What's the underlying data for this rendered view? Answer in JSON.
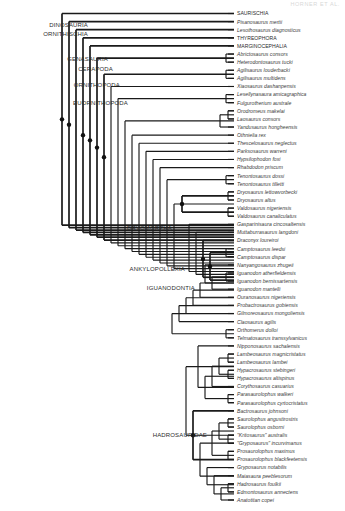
{
  "figure": {
    "header_text": "HORNER ET AL.",
    "background_color": "#ffffff",
    "line_color": "#1a1a1a",
    "taxon_text_color": "#3a3a3a",
    "clade_text_color": "#2b2b2b",
    "type": "cladogram",
    "width": 345,
    "height": 511
  },
  "clade_labels": [
    {
      "name": "DINOSAURIA",
      "text": "DINOSAURIA",
      "x": 88,
      "y": 27
    },
    {
      "name": "ORNITHISCHIA",
      "text": "ORNITHISCHIA",
      "x": 88,
      "y": 36
    },
    {
      "name": "GENASAURIA",
      "text": "GENASAURIA",
      "x": 108,
      "y": 61
    },
    {
      "name": "CERAPODA",
      "text": "CERAPODA",
      "x": 113,
      "y": 71
    },
    {
      "name": "ORNITHOPODA",
      "text": "ORNITHOPODA",
      "x": 120,
      "y": 87
    },
    {
      "name": "EUORNITHOPODA",
      "text": "EUORNITHOPODA",
      "x": 128,
      "y": 105
    },
    {
      "name": "DRYOMORPHA",
      "text": "DRYOMORPHA",
      "x": 172,
      "y": 230
    },
    {
      "name": "ANKYLOPOLLEXIA",
      "text": "ANKYLOPOLLEXIA",
      "x": 185,
      "y": 271
    },
    {
      "name": "IGUANODONTIA",
      "text": "IGUANODONTIA",
      "x": 195,
      "y": 290
    },
    {
      "name": "HADROSAURIDAE",
      "text": "HADROSAURIDAE",
      "x": 207,
      "y": 437
    }
  ],
  "taxa": [
    {
      "id": 0,
      "label": "SAURISCHIA",
      "style": "upright",
      "y": 13.5
    },
    {
      "id": 1,
      "label": "Pisanosaurus mertii",
      "style": "italic",
      "y": 22.0
    },
    {
      "id": 2,
      "label": "Lesothosaurus diagnosticus",
      "style": "italic",
      "y": 30.5
    },
    {
      "id": 3,
      "label": "THYREOPHORA",
      "style": "upright",
      "y": 39.0
    },
    {
      "id": 4,
      "label": "MARGINOCEPHALIA",
      "style": "upright",
      "y": 47.5
    },
    {
      "id": 5,
      "label": "Abrictosaurus consors",
      "style": "italic",
      "y": 56.0
    },
    {
      "id": 6,
      "label": "Heterodontosaurus tucki",
      "style": "italic",
      "y": 64.5
    },
    {
      "id": 7,
      "label": "Agilisaurus louderbacki",
      "style": "italic",
      "y": 73.0
    },
    {
      "id": 8,
      "label": "Agilisaurus multidens",
      "style": "italic",
      "y": 81.5
    },
    {
      "id": 9,
      "label": "Xiaosaurus dashanpensis",
      "style": "italic",
      "y": 90.0
    },
    {
      "id": 10,
      "label": "Lesellynasaura amicagraphica",
      "style": "italic",
      "y": 98.5
    },
    {
      "id": 11,
      "label": "Fulgurotherium australe",
      "style": "italic",
      "y": 107.0
    },
    {
      "id": 12,
      "label": "Orodromeus makelai",
      "style": "italic",
      "y": 115.5
    },
    {
      "id": 13,
      "label": "Laosaurus consors",
      "style": "italic",
      "y": 124.0
    },
    {
      "id": 14,
      "label": "Yandusaurus hongheensis",
      "style": "italic",
      "y": 132.5
    },
    {
      "id": 15,
      "label": "Othnielia rex",
      "style": "italic",
      "y": 141.0
    },
    {
      "id": 16,
      "label": "Thescelosaurus neglectus",
      "style": "italic",
      "y": 149.5
    },
    {
      "id": 17,
      "label": "Parksosaurus warreni",
      "style": "italic",
      "y": 158.0
    },
    {
      "id": 18,
      "label": "Hypsilophodon foxi",
      "style": "italic",
      "y": 166.5
    },
    {
      "id": 19,
      "label": "Rhabdodon priscum",
      "style": "italic",
      "y": 175.0
    },
    {
      "id": 20,
      "label": "Tenontosaurus dossi",
      "style": "italic",
      "y": 183.5
    },
    {
      "id": 21,
      "label": "Tenontosaurus tilletti",
      "style": "italic",
      "y": 192.0
    },
    {
      "id": 22,
      "label": "Dryosaurus lettowvorbecki",
      "style": "italic",
      "y": 200.5
    },
    {
      "id": 23,
      "label": "Dryosaurus altus",
      "style": "italic",
      "y": 209.0
    },
    {
      "id": 24,
      "label": "Valdosaurus nigeriensis",
      "style": "italic",
      "y": 217.5
    },
    {
      "id": 25,
      "label": "Valdosaurus canaliculatus",
      "style": "italic",
      "y": 226.0
    },
    {
      "id": 26,
      "label": "Gasparinisaura cincosaltensis",
      "style": "italic",
      "y": 234.5
    },
    {
      "id": 27,
      "label": "Muttaburrasaurus langdoni",
      "style": "italic",
      "y": 243.0
    },
    {
      "id": 28,
      "label": "Draconyx loureiroi",
      "style": "italic",
      "y": 251.5
    },
    {
      "id": 29,
      "label": "Camptosaurus leedsi",
      "style": "italic",
      "y": 260.0
    },
    {
      "id": 30,
      "label": "Camptosaurus dispar",
      "style": "italic",
      "y": 268.5
    },
    {
      "id": 31,
      "label": "Nanyangosaurus zhugeii",
      "style": "italic",
      "y": 277.0
    },
    {
      "id": 32,
      "label": "Iguanodon atherfieldensis",
      "style": "italic",
      "y": 285.5
    },
    {
      "id": 33,
      "label": "Iguanodon bernissartensis",
      "style": "italic",
      "y": 294.0
    },
    {
      "id": 34,
      "label": "Iguanodon mantelli",
      "style": "italic",
      "y": 302.5
    },
    {
      "id": 35,
      "label": "Ouranosaurus nigeriensis",
      "style": "italic",
      "y": 311.0
    },
    {
      "id": 36,
      "label": "Probactrosaurus gobiensis",
      "style": "italic",
      "y": 319.5
    },
    {
      "id": 37,
      "label": "Gilmoreosaurus mongoliensis",
      "style": "italic",
      "y": 328.0
    },
    {
      "id": 38,
      "label": "Claosaurus agilis",
      "style": "italic",
      "y": 336.5
    },
    {
      "id": 39,
      "label": "Orthomerus dolloi",
      "style": "italic",
      "y": 345.0
    },
    {
      "id": 40,
      "label": "Telmatosaurus transsylvanicus",
      "style": "italic",
      "y": 353.5
    },
    {
      "id": 41,
      "label": "Nipponosaurus sachalensis",
      "style": "italic",
      "y": 362.0
    },
    {
      "id": 42,
      "label": "Lambeosaurus magnicristatus",
      "style": "italic",
      "y": 370.5
    },
    {
      "id": 43,
      "label": "Lambeosaurus lambei",
      "style": "italic",
      "y": 379.0
    },
    {
      "id": 44,
      "label": "Hypacrosaurus stebingeri",
      "style": "italic",
      "y": 387.5
    },
    {
      "id": 45,
      "label": "Hypacrosaurus altispinus",
      "style": "italic",
      "y": 396.0
    },
    {
      "id": 46,
      "label": "Corythosaurus casuarius",
      "style": "italic",
      "y": 404.5
    },
    {
      "id": 47,
      "label": "Parasaurolophus walkeri",
      "style": "italic",
      "y": 413.0
    },
    {
      "id": 48,
      "label": "Parasaurolophus cyrtocristatus",
      "style": "italic",
      "y": 421.5
    },
    {
      "id": 49,
      "label": "Bactrosaurus johnsoni",
      "style": "italic",
      "y": 430.0
    },
    {
      "id": 50,
      "label": "Saurolophus angustirostris",
      "style": "italic",
      "y": 438.5
    },
    {
      "id": 51,
      "label": "Saurolophus osborni",
      "style": "italic",
      "y": 447.0
    },
    {
      "id": 52,
      "label": "\"Kritosaurus\" australis",
      "style": "italic",
      "y": 455.5
    },
    {
      "id": 53,
      "label": "\"Gryposaurus\" incurvimanus",
      "style": "italic",
      "y": 464.0
    },
    {
      "id": 54,
      "label": "Prosaurolophus maximus",
      "style": "italic",
      "y": 472.5
    },
    {
      "id": 55,
      "label": "Prosaurolophus blackfeetensis",
      "style": "italic",
      "y": 481.0
    },
    {
      "id": 56,
      "label": "Gryposaurus notabilis",
      "style": "italic",
      "y": 489.5
    },
    {
      "id": 57,
      "label": "Maiasaura peeblesorum",
      "style": "italic",
      "y": 498.0
    },
    {
      "id": 58,
      "label": "Hadrosaurus foulkii",
      "style": "italic",
      "y": 506.5
    },
    {
      "id": 59,
      "label": "Edmontosaurus annectens",
      "style": "italic",
      "y": 515.0
    },
    {
      "id": 60,
      "label": "Anatotitan copei",
      "style": "italic",
      "y": 523.5
    }
  ],
  "tip_x": 234,
  "label_x": 237,
  "internal_nodes": [
    {
      "name": "dinosauria-node",
      "x": 62,
      "children_y": [
        13.5,
        235.4
      ],
      "dot": true,
      "thick": true
    },
    {
      "name": "ornithischia-node",
      "x": 69,
      "children_y": [
        22.0,
        238.0
      ],
      "dot": true,
      "thick": true
    },
    {
      "name": "node-c",
      "x": 76,
      "children_y": [
        30.5,
        240.5
      ],
      "dot": false,
      "thick": true
    },
    {
      "name": "genasauria-node",
      "x": 83,
      "children_y": [
        39.0,
        243.0
      ],
      "dot": true,
      "thick": true
    },
    {
      "name": "cerapoda-node",
      "x": 90,
      "children_y": [
        47.5,
        245.5
      ],
      "dot": true,
      "thick": true
    },
    {
      "name": "ornithopoda-node",
      "x": 97,
      "children_y": [
        60.2,
        248.0
      ],
      "dot": true,
      "thick": true
    },
    {
      "name": "heterodont-node",
      "x": 226,
      "children_y": [
        56.0,
        64.5
      ],
      "dot": false,
      "thick": false
    },
    {
      "name": "euornithopoda-node",
      "x": 104,
      "children_y": [
        77.2,
        251.0
      ],
      "dot": true,
      "thick": true
    },
    {
      "name": "agilisaurus-node",
      "x": 226,
      "children_y": [
        73.0,
        81.5
      ],
      "dot": false,
      "thick": false
    },
    {
      "name": "node-xiao",
      "x": 111,
      "children_y": [
        90.0,
        254.0
      ],
      "dot": false,
      "thick": false
    },
    {
      "name": "leaell-node",
      "x": 226,
      "children_y": [
        98.5,
        107.0
      ],
      "dot": false,
      "thick": false
    },
    {
      "name": "node-leaell-up",
      "x": 118,
      "children_y": [
        102.7,
        257.0
      ],
      "dot": false,
      "thick": false
    },
    {
      "name": "orodromeus-node",
      "x": 228,
      "children_y": [
        115.5,
        124.0
      ],
      "dot": false,
      "thick": false
    },
    {
      "name": "yandu-node",
      "x": 220,
      "children_y": [
        119.7,
        132.5
      ],
      "dot": false,
      "thick": false
    },
    {
      "name": "node-yandu-up",
      "x": 125,
      "children_y": [
        126.1,
        260.0
      ],
      "dot": false,
      "thick": false
    },
    {
      "name": "node-othnielia",
      "x": 132,
      "children_y": [
        141.0,
        263.0
      ],
      "dot": false,
      "thick": false
    },
    {
      "name": "node-thescelo",
      "x": 139,
      "children_y": [
        149.5,
        266.0
      ],
      "dot": false,
      "thick": false
    },
    {
      "name": "node-parkso",
      "x": 146,
      "children_y": [
        158.0,
        269.0
      ],
      "dot": false,
      "thick": false
    },
    {
      "name": "node-hypsilo",
      "x": 153,
      "children_y": [
        166.5,
        272.0
      ],
      "dot": false,
      "thick": false
    },
    {
      "name": "node-rhabdodon",
      "x": 160,
      "children_y": [
        175.0,
        275.0
      ],
      "dot": false,
      "thick": false
    },
    {
      "name": "tenontosaurus-node",
      "x": 226,
      "children_y": [
        183.5,
        192.0
      ],
      "dot": false,
      "thick": false
    },
    {
      "name": "node-tenonto-up",
      "x": 167,
      "children_y": [
        187.7,
        278.0
      ],
      "dot": false,
      "thick": false
    },
    {
      "name": "dryosaurus-node",
      "x": 228,
      "children_y": [
        200.5,
        209.0
      ],
      "dot": false,
      "thick": false
    },
    {
      "name": "valdosaurus-node",
      "x": 228,
      "children_y": [
        217.5,
        226.0
      ],
      "dot": false,
      "thick": false
    },
    {
      "name": "dryomorpha-node",
      "x": 182,
      "children_y": [
        204.7,
        221.7
      ],
      "dot": true,
      "thick": true
    },
    {
      "name": "node-dryo-up",
      "x": 174,
      "children_y": [
        213.2,
        281.0
      ],
      "dot": false,
      "thick": false
    },
    {
      "name": "node-gaspari",
      "x": 189,
      "children_y": [
        234.5,
        284.0
      ],
      "dot": false,
      "thick": false
    },
    {
      "name": "node-muttabur",
      "x": 196,
      "children_y": [
        243.0,
        287.0
      ],
      "dot": false,
      "thick": false
    },
    {
      "name": "ankylopollexia-node",
      "x": 203,
      "children_y": [
        251.5,
        290.0
      ],
      "dot": true,
      "thick": true
    },
    {
      "name": "camptosaurus-node",
      "x": 226,
      "children_y": [
        260.0,
        268.5
      ],
      "dot": false,
      "thick": false
    },
    {
      "name": "iguanodontia-node",
      "x": 210,
      "children_y": [
        264.2,
        293.0
      ],
      "dot": true,
      "thick": true
    },
    {
      "name": "node-nanyango",
      "x": 205,
      "children_y": [
        277.0,
        296.0
      ],
      "dot": false,
      "thick": false
    },
    {
      "name": "iguanodon-node",
      "x": 226,
      "children_y": [
        285.5,
        294.0
      ],
      "dot": false,
      "thick": false
    },
    {
      "name": "node-iguanodon-up",
      "x": 212,
      "children_y": [
        289.7,
        302.5
      ],
      "dot": false,
      "thick": false
    },
    {
      "name": "node-ouranosaurus",
      "x": 200,
      "children_y": [
        296.0,
        311.0
      ],
      "dot": false,
      "thick": false
    },
    {
      "name": "node-probactro",
      "x": 193,
      "children_y": [
        303.5,
        319.5
      ],
      "dot": false,
      "thick": false
    },
    {
      "name": "node-gilmoreo",
      "x": 186,
      "children_y": [
        311.5,
        328.0
      ],
      "dot": false,
      "thick": false
    },
    {
      "name": "node-claosaurus",
      "x": 179,
      "children_y": [
        319.7,
        336.5
      ],
      "dot": false,
      "thick": false
    },
    {
      "name": "orthomerus-node",
      "x": 226,
      "children_y": [
        345.0,
        353.5
      ],
      "dot": false,
      "thick": false
    },
    {
      "name": "node-ortho-up",
      "x": 172,
      "children_y": [
        328.1,
        349.2
      ],
      "dot": false,
      "thick": false
    },
    {
      "name": "lambeosaurus-node",
      "x": 228,
      "children_y": [
        370.5,
        379.0
      ],
      "dot": false,
      "thick": false
    },
    {
      "name": "hypacrosaurus-node",
      "x": 228,
      "children_y": [
        387.5,
        396.0
      ],
      "dot": false,
      "thick": false
    },
    {
      "name": "node-lamb-hypa",
      "x": 219,
      "children_y": [
        374.7,
        391.7
      ],
      "dot": false,
      "thick": false
    },
    {
      "name": "node-corytho",
      "x": 212,
      "children_y": [
        383.2,
        404.5
      ],
      "dot": false,
      "thick": false
    },
    {
      "name": "parasaurolophus-node",
      "x": 228,
      "children_y": [
        413.0,
        421.5
      ],
      "dot": false,
      "thick": false
    },
    {
      "name": "lambeosaurinae-node",
      "x": 205,
      "children_y": [
        393.8,
        417.2
      ],
      "dot": false,
      "thick": false
    },
    {
      "name": "node-nippono",
      "x": 198,
      "children_y": [
        362.0,
        405.5
      ],
      "dot": false,
      "thick": false
    },
    {
      "name": "saurolophus-node",
      "x": 228,
      "children_y": [
        438.5,
        447.0
      ],
      "dot": false,
      "thick": false
    },
    {
      "name": "kritosaurus-node",
      "x": 228,
      "children_y": [
        455.5,
        464.0
      ],
      "dot": false,
      "thick": false
    },
    {
      "name": "node-sauro-krito",
      "x": 219,
      "children_y": [
        442.7,
        459.7
      ],
      "dot": false,
      "thick": false
    },
    {
      "name": "prosaurolophus-node",
      "x": 228,
      "children_y": [
        472.5,
        481.0
      ],
      "dot": false,
      "thick": false
    },
    {
      "name": "node-pro-up",
      "x": 212,
      "children_y": [
        451.2,
        476.7
      ],
      "dot": false,
      "thick": false
    },
    {
      "name": "edmonto-node",
      "x": 228,
      "children_y": [
        506.5,
        515.0
      ],
      "dot": false,
      "thick": false
    },
    {
      "name": "node-anato",
      "x": 221,
      "children_y": [
        510.7,
        523.5
      ],
      "dot": false,
      "thick": false
    },
    {
      "name": "node-hadrosaurus",
      "x": 214,
      "children_y": [
        498.0,
        517.1
      ],
      "dot": false,
      "thick": false
    },
    {
      "name": "node-maiasaura",
      "x": 207,
      "children_y": [
        489.5,
        507.5
      ],
      "dot": false,
      "thick": false
    },
    {
      "name": "saurolophinae-node",
      "x": 200,
      "children_y": [
        463.9,
        498.5
      ],
      "dot": false,
      "thick": false
    },
    {
      "name": "hadrosauridae-node",
      "x": 193,
      "children_y": [
        430.0,
        481.2
      ],
      "dot": true,
      "thick": true
    },
    {
      "name": "node-hadro-up",
      "x": 186,
      "children_y": [
        383.7,
        455.6
      ],
      "dot": false,
      "thick": false
    }
  ]
}
